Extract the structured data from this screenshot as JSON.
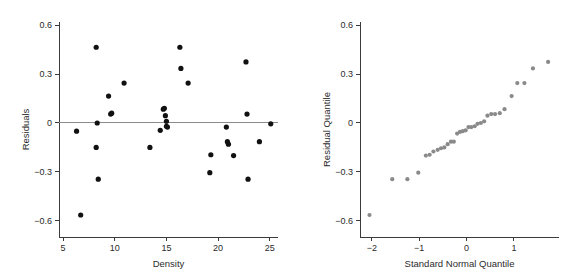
{
  "figure": {
    "background_color": "#ffffff",
    "panels": [
      "residuals-vs-density",
      "normal-qq-plot"
    ]
  },
  "chart_data": [
    {
      "id": "residuals-vs-density",
      "type": "scatter",
      "title": "",
      "xlabel": "Density",
      "ylabel": "Residuals",
      "xlim": [
        4.6,
        25.8
      ],
      "ylim": [
        -0.7,
        0.62
      ],
      "xticks": [
        5,
        10,
        15,
        20,
        25
      ],
      "xtick_labels": [
        "5",
        "10",
        "15",
        "20",
        "25"
      ],
      "yticks": [
        -0.6,
        -0.3,
        0,
        0.3,
        0.6
      ],
      "ytick_labels": [
        "−0.6",
        "−0.3",
        "0",
        "0.3",
        "0.6"
      ],
      "grid": false,
      "legend": "none",
      "reference_line": {
        "type": "horizontal",
        "y": 0,
        "color": "#8c8c8c"
      },
      "marker": {
        "shape": "circle",
        "color": "#111111",
        "size": 2.6
      },
      "x": [
        6.3,
        6.7,
        8.2,
        8.2,
        8.3,
        8.4,
        9.4,
        9.6,
        9.7,
        10.9,
        13.4,
        14.4,
        14.7,
        14.8,
        14.9,
        15.0,
        15.0,
        15.1,
        16.3,
        16.4,
        17.1,
        19.2,
        19.3,
        20.8,
        20.9,
        21.0,
        21.5,
        22.7,
        22.8,
        22.9,
        24.0,
        25.1
      ],
      "y": [
        -0.05,
        -0.565,
        0.465,
        -0.15,
        0.0,
        -0.345,
        0.165,
        0.055,
        0.06,
        0.245,
        -0.15,
        -0.045,
        0.085,
        0.09,
        0.045,
        0.01,
        -0.02,
        -0.025,
        0.465,
        0.335,
        0.245,
        -0.305,
        -0.195,
        -0.025,
        -0.115,
        -0.13,
        -0.2,
        0.375,
        0.055,
        -0.345,
        -0.115,
        -0.005
      ]
    },
    {
      "id": "normal-qq-plot",
      "type": "scatter",
      "title": "",
      "xlabel": "Standard Normal Quantile",
      "ylabel": "Residual Quantile",
      "xlim": [
        -2.25,
        1.95
      ],
      "ylim": [
        -0.7,
        0.62
      ],
      "xticks": [
        -2,
        -1,
        0,
        1
      ],
      "xtick_labels": [
        "−2",
        "−1",
        "0",
        "1"
      ],
      "yticks": [
        -0.6,
        -0.3,
        0,
        0.3,
        0.6
      ],
      "ytick_labels": [
        "−0.6",
        "−0.3",
        "0",
        "0.3",
        "0.6"
      ],
      "grid": false,
      "legend": "none",
      "marker": {
        "shape": "circle",
        "color": "#8a8a8a",
        "size": 2.1
      },
      "x": [
        -2.05,
        -1.57,
        -1.25,
        -1.02,
        -0.86,
        -0.78,
        -0.7,
        -0.61,
        -0.54,
        -0.47,
        -0.4,
        -0.33,
        -0.27,
        -0.2,
        -0.14,
        -0.08,
        -0.02,
        0.04,
        0.1,
        0.17,
        0.23,
        0.3,
        0.37,
        0.44,
        0.52,
        0.6,
        0.7,
        0.8,
        0.95,
        1.07,
        1.22,
        1.4,
        1.72
      ],
      "y": [
        -0.565,
        -0.345,
        -0.345,
        -0.305,
        -0.2,
        -0.195,
        -0.175,
        -0.165,
        -0.155,
        -0.15,
        -0.13,
        -0.115,
        -0.115,
        -0.065,
        -0.055,
        -0.05,
        -0.045,
        -0.025,
        -0.025,
        -0.02,
        -0.005,
        0.0,
        0.01,
        0.045,
        0.055,
        0.055,
        0.06,
        0.085,
        0.165,
        0.245,
        0.245,
        0.335,
        0.375,
        0.465
      ]
    }
  ]
}
